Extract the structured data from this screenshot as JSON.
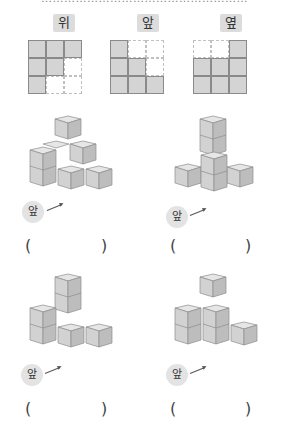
{
  "header": {
    "cut_text": "………………………………………………"
  },
  "views": [
    {
      "label": "위",
      "grid": [
        [
          1,
          1,
          1
        ],
        [
          1,
          1,
          0
        ],
        [
          1,
          0,
          0
        ]
      ]
    },
    {
      "label": "앞",
      "grid": [
        [
          1,
          0,
          0
        ],
        [
          1,
          1,
          0
        ],
        [
          1,
          1,
          1
        ]
      ]
    },
    {
      "label": "옆",
      "grid": [
        [
          0,
          0,
          1
        ],
        [
          1,
          1,
          1
        ],
        [
          1,
          1,
          1
        ]
      ]
    }
  ],
  "options": [
    {
      "front_label": "앞",
      "paren_open": "(",
      "paren_close": ")"
    },
    {
      "front_label": "앞",
      "paren_open": "(",
      "paren_close": ")"
    },
    {
      "front_label": "앞",
      "paren_open": "(",
      "paren_close": ")"
    },
    {
      "front_label": "앞",
      "paren_open": "(",
      "paren_close": ")"
    }
  ],
  "colors": {
    "cube_top": "#e6e6e6",
    "cube_left": "#d2d2d2",
    "cube_right": "#bdbdbd",
    "cube_edge": "#8c8c8c",
    "badge_bg": "#dcdcdc"
  }
}
